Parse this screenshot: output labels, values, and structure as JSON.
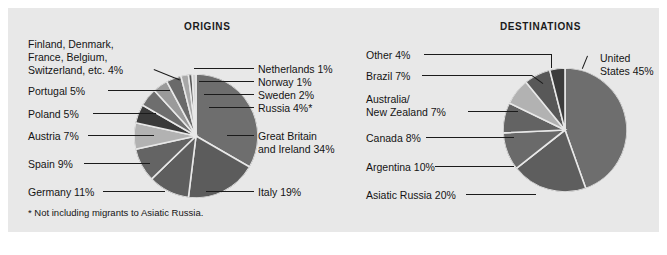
{
  "figure": {
    "background_color": "#e8e8e8",
    "page_background": "#ffffff"
  },
  "origins": {
    "title": "ORIGINS",
    "footnote": "* Not including migrants to Asiatic Russia.",
    "labels": {
      "finland_group": "Finland, Denmark,",
      "finland_group_2": "France, Belgium,",
      "finland_group_3": "Switzerland, etc.  4%",
      "portugal": "Portugal  5%",
      "poland": "Poland  5%",
      "austria": "Austria  7%",
      "spain": "Spain  9%",
      "germany": "Germany  11%",
      "netherlands": "Netherlands  1%",
      "norway": "Norway  1%",
      "sweden": "Sweden  2%",
      "russia": "Russia  4%*",
      "great_britain": "Great Britain",
      "great_britain_2": "and Ireland  34%",
      "italy": "Italy  19%"
    }
  },
  "destinations": {
    "title": "DESTINATIONS",
    "labels": {
      "other": "Other  4%",
      "brazil": "Brazil  7%",
      "australia": "Australia/",
      "australia_2": "New Zealand  7%",
      "canada": "Canada  8%",
      "argentina": "Argentina  10%",
      "asiatic_russia": "Asiatic Russia  20%",
      "united_states": "United",
      "united_states_2": "States 45%"
    }
  },
  "chart_data": [
    {
      "type": "pie",
      "title": "ORIGINS",
      "note": "* Not including migrants to Asiatic Russia.",
      "legend_position": "callout-labels",
      "center": [
        188,
        128
      ],
      "radius": 62,
      "start_angle_deg": -90,
      "direction": "clockwise",
      "categories": [
        "Great Britain and Ireland",
        "Italy",
        "Germany",
        "Spain",
        "Austria",
        "Poland",
        "Portugal",
        "Finland, Denmark, France, Belgium, Switzerland, etc.",
        "Russia",
        "Sweden",
        "Norway",
        "Netherlands"
      ],
      "values": [
        34,
        19,
        11,
        9,
        7,
        5,
        5,
        4,
        4,
        2,
        1,
        1
      ],
      "labels": [
        "Great Britain and Ireland  34%",
        "Italy  19%",
        "Germany  11%",
        "Spain  9%",
        "Austria  7%",
        "Poland  5%",
        "Portugal  5%",
        "Finland, Denmark, France, Belgium, Switzerland, etc.  4%",
        "Russia  4%*",
        "Sweden  2%",
        "Norway  1%",
        "Netherlands  1%"
      ],
      "colors": [
        "#6e6e6e",
        "#5c5c5c",
        "#5e5e5e",
        "#646464",
        "#b2b2b2",
        "#3a3a3a",
        "#6e6e6e",
        "#9a9a9a",
        "#6a6a6a",
        "#a8a8a8",
        "#5a5a5a",
        "#d2d2d2"
      ],
      "unit": "percent"
    },
    {
      "type": "pie",
      "title": "DESTINATIONS",
      "legend_position": "callout-labels",
      "center": [
        557,
        130
      ],
      "radius": 62,
      "start_angle_deg": -90,
      "direction": "clockwise",
      "categories": [
        "United States",
        "Asiatic Russia",
        "Argentina",
        "Canada",
        "Australia/New Zealand",
        "Brazil",
        "Other"
      ],
      "values": [
        45,
        20,
        10,
        8,
        7,
        7,
        4
      ],
      "labels": [
        "United States 45%",
        "Asiatic Russia  20%",
        "Argentina  10%",
        "Canada  8%",
        "Australia/New Zealand  7%",
        "Brazil  7%",
        "Other  4%"
      ],
      "colors": [
        "#6e6e6e",
        "#5e5e5e",
        "#6a6a6a",
        "#636363",
        "#b2b2b2",
        "#585858",
        "#3c3c3c"
      ],
      "unit": "percent"
    }
  ]
}
